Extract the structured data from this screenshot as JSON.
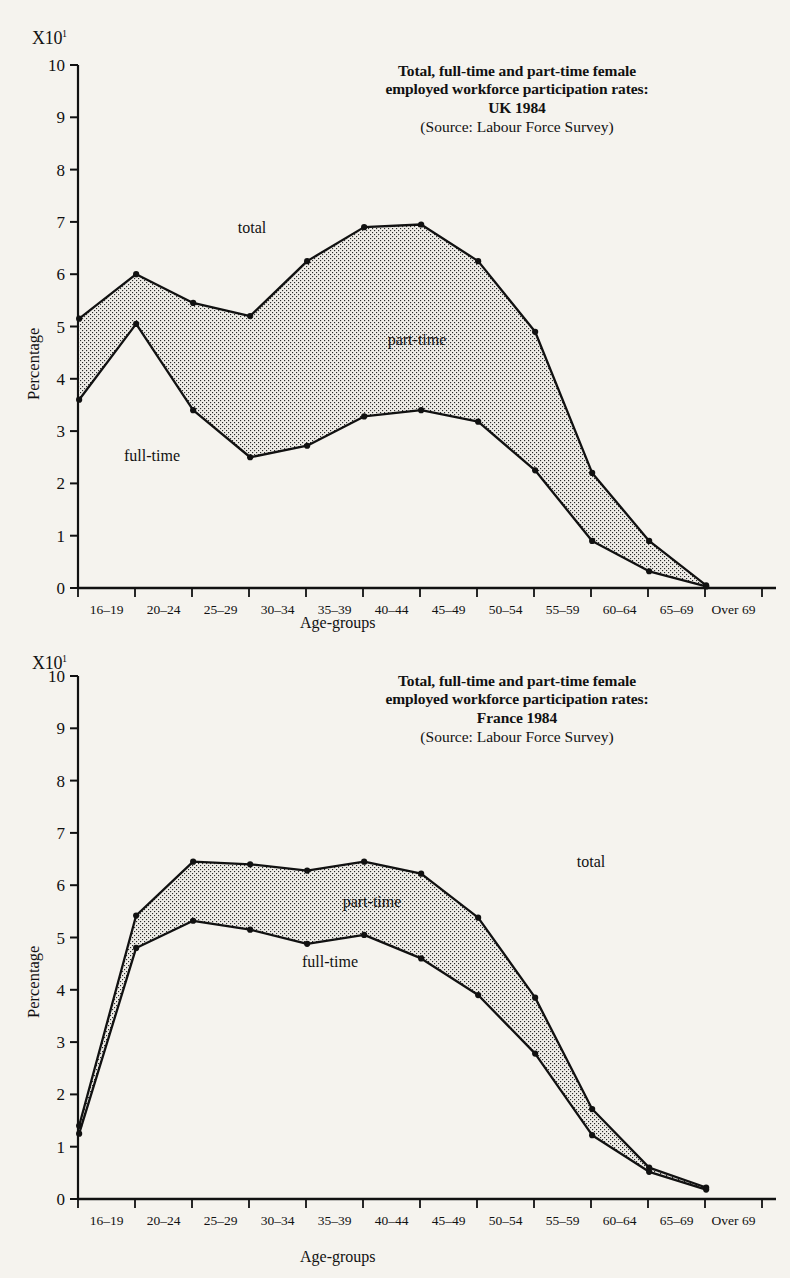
{
  "page": {
    "background_color": "#f5f3ee",
    "ink_color": "#111111",
    "fill_color": "#e8e6e0"
  },
  "charts": [
    {
      "id": "uk",
      "axis_multiplier_prefix": "X10",
      "axis_multiplier_exponent": "1",
      "title_lines": [
        "Total, full-time and part-time female",
        "employed workforce participation rates:",
        "UK 1984"
      ],
      "source": "(Source: Labour Force Survey)",
      "ylabel": "Percentage",
      "xlabel": "Age-groups",
      "series_labels": {
        "total": "total",
        "part_time": "part-time",
        "full_time": "full-time"
      },
      "chart_data": {
        "type": "area",
        "title": "Total, full-time and part-time female employed workforce participation rates: UK 1984",
        "subtitle": "(Source: Labour Force Survey)",
        "xlabel": "Age-groups",
        "ylabel": "Percentage",
        "y_multiplier": "x10",
        "ylim": [
          0,
          10
        ],
        "yticks": [
          0,
          1,
          2,
          3,
          4,
          5,
          6,
          7,
          8,
          9,
          10
        ],
        "grid": false,
        "legend_position": "inline-annotations",
        "categories": [
          "16–19",
          "20–24",
          "25–29",
          "30–34",
          "35–39",
          "40–44",
          "45–49",
          "50–54",
          "55–59",
          "60–64",
          "65–69",
          "Over 69"
        ],
        "series": [
          {
            "name": "total",
            "values": [
              5.15,
              6.0,
              5.45,
              5.2,
              6.25,
              6.9,
              6.95,
              6.25,
              4.9,
              2.2,
              0.9,
              0.05
            ]
          },
          {
            "name": "full-time",
            "values": [
              3.6,
              5.05,
              3.4,
              2.5,
              2.72,
              3.28,
              3.4,
              3.18,
              2.25,
              0.9,
              0.32,
              0.03
            ]
          }
        ],
        "band_label": "part-time",
        "band_note": "shaded band between total and full-time represents part-time"
      }
    },
    {
      "id": "fr",
      "axis_multiplier_prefix": "X10",
      "axis_multiplier_exponent": "1",
      "title_lines": [
        "Total, full-time and part-time female",
        "employed workforce participation rates:",
        "France 1984"
      ],
      "source": "(Source: Labour Force Survey)",
      "ylabel": "Percentage",
      "xlabel": "Age-groups",
      "series_labels": {
        "total": "total",
        "part_time": "part-time",
        "full_time": "full-time"
      },
      "chart_data": {
        "type": "area",
        "title": "Total, full-time and part-time female employed workforce participation rates: France 1984",
        "subtitle": "(Source: Labour Force Survey)",
        "xlabel": "Age-groups",
        "ylabel": "Percentage",
        "y_multiplier": "x10",
        "ylim": [
          0,
          10
        ],
        "yticks": [
          0,
          1,
          2,
          3,
          4,
          5,
          6,
          7,
          8,
          9,
          10
        ],
        "grid": false,
        "legend_position": "inline-annotations",
        "categories": [
          "16–19",
          "20–24",
          "25–29",
          "30–34",
          "35–39",
          "40–44",
          "45–49",
          "50–54",
          "55–59",
          "60–64",
          "65–69",
          "Over 69"
        ],
        "series": [
          {
            "name": "total",
            "values": [
              1.4,
              5.42,
              6.45,
              6.4,
              6.28,
              6.45,
              6.22,
              5.38,
              3.85,
              1.72,
              0.6,
              0.22
            ]
          },
          {
            "name": "full-time",
            "values": [
              1.25,
              4.8,
              5.32,
              5.15,
              4.88,
              5.05,
              4.6,
              3.9,
              2.78,
              1.22,
              0.52,
              0.18
            ]
          }
        ],
        "band_label": "part-time",
        "band_note": "shaded band between total and full-time represents part-time"
      }
    }
  ]
}
